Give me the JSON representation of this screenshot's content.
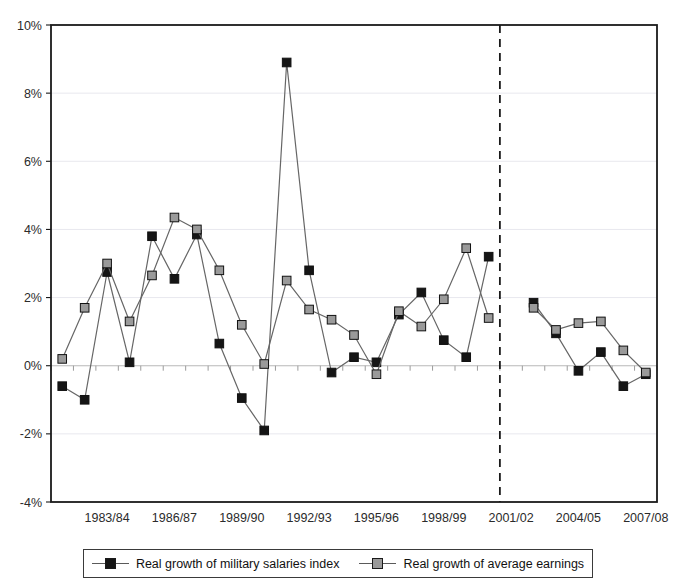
{
  "chart_data": {
    "type": "line",
    "title": "",
    "xlabel": "",
    "ylabel": "",
    "ylim": [
      -4,
      10
    ],
    "ytick_values": [
      -4,
      -2,
      0,
      2,
      4,
      6,
      8,
      10
    ],
    "ytick_labels": [
      "-4%",
      "-2%",
      "0%",
      "2%",
      "4%",
      "6%",
      "8%",
      "10%"
    ],
    "grid": "horizontal-light",
    "legend_position": "below-plot",
    "x": [
      "1981/82",
      "1982/83",
      "1983/84",
      "1984/85",
      "1985/86",
      "1986/87",
      "1987/88",
      "1988/89",
      "1989/90",
      "1990/91",
      "1991/92",
      "1992/93",
      "1993/94",
      "1994/95",
      "1995/96",
      "1996/97",
      "1997/98",
      "1998/99",
      "1999/00",
      "2000/01",
      "2001/02",
      "2002/03",
      "2003/04",
      "2004/05",
      "2005/06",
      "2006/07",
      "2007/08"
    ],
    "xtick_labels": [
      "1983/84",
      "1986/87",
      "1989/90",
      "1992/93",
      "1995/96",
      "1998/99",
      "2001/02",
      "2004/05",
      "2007/08"
    ],
    "xtick_label_indices": [
      2,
      5,
      8,
      11,
      14,
      17,
      20,
      23,
      26
    ],
    "break_after_index": 19,
    "break_note": "dashed vertical line separating series break between 2000/01 and 2001/02",
    "series": [
      {
        "name": "Real growth of military salaries index",
        "marker": "filled-square-black",
        "color": "#151515",
        "values": [
          -0.6,
          -1.0,
          2.75,
          0.1,
          3.8,
          2.55,
          3.85,
          0.65,
          -0.95,
          -1.9,
          8.9,
          2.8,
          -0.2,
          0.25,
          0.1,
          1.5,
          2.15,
          0.75,
          0.25,
          3.2,
          null,
          1.85,
          0.95,
          -0.15,
          0.4,
          -0.6,
          -0.25
        ]
      },
      {
        "name": "Real growth of average earnings",
        "marker": "filled-square-grey",
        "color": "#9a9a9a",
        "values": [
          0.2,
          1.7,
          3.0,
          1.3,
          2.65,
          4.35,
          4.0,
          2.8,
          1.2,
          0.05,
          2.5,
          1.65,
          1.35,
          0.9,
          -0.25,
          1.6,
          1.15,
          1.95,
          3.45,
          1.4,
          null,
          1.7,
          1.05,
          1.25,
          1.3,
          0.45,
          -0.2
        ]
      }
    ]
  },
  "legend": {
    "items": [
      {
        "label": "Real growth of military salaries index",
        "swatch": "black"
      },
      {
        "label": "Real growth of average earnings",
        "swatch": "grey"
      }
    ]
  },
  "colors": {
    "series_black": "#151515",
    "series_grey": "#9a9a9a",
    "axis": "#1a1a1a",
    "grid": "#e8e8ee",
    "zero_line": "#b9b9b9",
    "break_line": "#1a1a1a",
    "background": "#ffffff"
  }
}
